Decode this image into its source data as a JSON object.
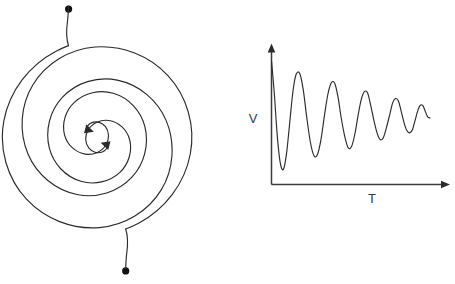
{
  "figure": {
    "background_color": "#ffffff",
    "stroke_color": "#2b2b2b",
    "axis_color": "#3a3a3a",
    "width": 455,
    "height": 284
  },
  "spiral_diagram": {
    "name": "two-armed-spiral",
    "description": "Double Archimedean spiral with two arms converging inward to a common center, each arm terminating in an arrowhead at the center and a round dot at its outer end.",
    "center": {
      "x": 97,
      "y": 137
    },
    "arms": 2,
    "turns": 1.85,
    "direction": "inward",
    "arm_a_endpoint_dot": {
      "x": 69,
      "y": 9
    },
    "arm_b_endpoint_dot": {
      "x": 125,
      "y": 271
    },
    "arrowhead_a": {
      "x": 90,
      "y": 128,
      "label": "inward-arrow-upper"
    },
    "arrowhead_b": {
      "x": 105,
      "y": 147,
      "label": "inward-arrow-lower"
    },
    "inner_radius": 11,
    "outer_radius": 132
  },
  "chart_data": {
    "type": "line",
    "title": "",
    "subtitle": "",
    "xlabel": "T",
    "ylabel": "V",
    "grid": false,
    "legend": null,
    "xlim": [
      0,
      10
    ],
    "ylim": [
      -1.05,
      1.05
    ],
    "series": [
      {
        "name": "damped-oscillation",
        "color": "#2b2b2b",
        "x": [
          0.0,
          0.18,
          0.36,
          0.55,
          0.75,
          0.95,
          1.15,
          1.35,
          1.55,
          1.78,
          2.0,
          2.22,
          2.45,
          2.68,
          2.9,
          3.12,
          3.34,
          3.56,
          3.78,
          4.0,
          4.2,
          4.4,
          4.62,
          4.84,
          5.05,
          5.26,
          5.46,
          5.66,
          5.86,
          6.06,
          6.26,
          6.46,
          6.66,
          6.86,
          7.06,
          7.26,
          7.46,
          7.64,
          7.82,
          8.0,
          8.18,
          8.36,
          8.54,
          8.72,
          8.9,
          9.06,
          9.22,
          9.38,
          9.54,
          9.7,
          9.85,
          10.0
        ],
        "y": [
          1.0,
          0.42,
          -0.3,
          -0.78,
          -0.9,
          -0.62,
          -0.08,
          0.46,
          0.76,
          0.78,
          0.5,
          0.02,
          -0.42,
          -0.66,
          -0.64,
          -0.38,
          0.04,
          0.42,
          0.62,
          0.6,
          0.36,
          0.0,
          -0.32,
          -0.52,
          -0.5,
          -0.28,
          0.04,
          0.32,
          0.46,
          0.44,
          0.22,
          -0.04,
          -0.26,
          -0.38,
          -0.34,
          -0.16,
          0.06,
          0.26,
          0.34,
          0.3,
          0.12,
          -0.08,
          -0.22,
          -0.26,
          -0.2,
          -0.04,
          0.12,
          0.22,
          0.22,
          0.12,
          0.02,
          0.0
        ]
      }
    ],
    "peaks": {
      "values": [
        1.0,
        0.78,
        0.62,
        0.46,
        0.34,
        0.22
      ],
      "times": [
        0.0,
        1.7,
        3.75,
        5.82,
        7.9,
        9.45
      ]
    },
    "troughs": {
      "values": [
        -0.9,
        -0.66,
        -0.52,
        -0.38,
        -0.26
      ],
      "times": [
        0.8,
        2.72,
        4.78,
        6.84,
        8.7
      ]
    },
    "axes": {
      "y_axis": {
        "from": {
          "x": 0,
          "y": -1.05
        },
        "to": {
          "x": 0,
          "y": 1.18
        },
        "arrow": "up"
      },
      "x_axis": {
        "from": {
          "x": 0,
          "y": -1.05
        },
        "to": {
          "x": 10.9,
          "y": -1.05
        },
        "arrow": "right"
      }
    }
  },
  "labels": {
    "v_axis": "V",
    "t_axis": "T"
  }
}
